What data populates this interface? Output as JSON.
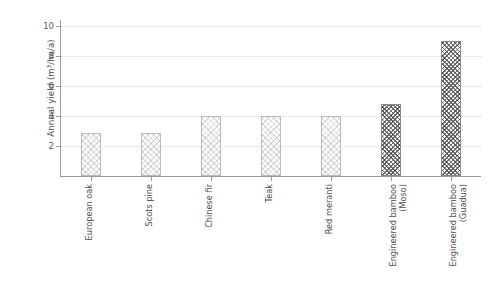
{
  "chart_data": {
    "type": "bar",
    "title": "",
    "subtitle": "",
    "xlabel": "",
    "ylabel": "Annual yield (m³/ha/a)",
    "categories": [
      "European oak",
      "Scots pine",
      "Chinese fir",
      "Teak",
      "Red meranti",
      "Engineered bamboo (Moso)",
      "Engineered bamboo (Guadua)"
    ],
    "category_lines": [
      [
        "European oak"
      ],
      [
        "Scots pine"
      ],
      [
        "Chinese fir"
      ],
      [
        "Teak"
      ],
      [
        "Red meranti"
      ],
      [
        "Engineered bamboo",
        "(Moso)"
      ],
      [
        "Engineered bamboo",
        "(Guadua)"
      ]
    ],
    "values": [
      2.9,
      2.9,
      4.0,
      4.0,
      4.0,
      4.8,
      9.0
    ],
    "bar_styles": [
      "wood",
      "wood",
      "wood",
      "wood",
      "wood",
      "bamboo",
      "bamboo"
    ],
    "ylim": [
      0,
      10.4
    ],
    "yticks": [
      2,
      4,
      6,
      8,
      10
    ],
    "ytick_labels": [
      "2",
      "4",
      "6",
      "8",
      "10"
    ],
    "grid": true,
    "grid_axis": "y",
    "grid_style": "dotted",
    "legend": null,
    "colors": {
      "bar_face_wood": "#fdfdfd",
      "bar_edge_wood": "#b9b9b9",
      "bar_face_bamboo": "#fbfbfb",
      "bar_edge_bamboo": "#8a8a8a",
      "grid": "#d8d8d8",
      "axis": "#9a9a9a",
      "text": "#4d4d4d",
      "background": "#ffffff"
    }
  }
}
